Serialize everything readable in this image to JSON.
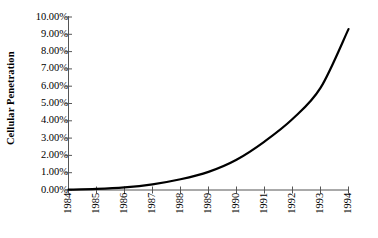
{
  "chart_data": {
    "type": "line",
    "title": "",
    "xlabel": "",
    "ylabel": "Cellular Penetration",
    "categories": [
      "1984",
      "1985",
      "1986",
      "1987",
      "1988",
      "1989",
      "1990",
      "1991",
      "1992",
      "1993",
      "1994"
    ],
    "x": [
      1984,
      1985,
      1986,
      1987,
      1988,
      1989,
      1990,
      1991,
      1992,
      1993,
      1994
    ],
    "values": [
      0.02,
      0.06,
      0.15,
      0.33,
      0.62,
      1.05,
      1.75,
      2.8,
      4.1,
      5.9,
      9.3
    ],
    "ylim": [
      0,
      10
    ],
    "xlim": [
      1984,
      1994
    ],
    "ytick_values": [
      0,
      1,
      2,
      3,
      4,
      5,
      6,
      7,
      8,
      9,
      10
    ],
    "ytick_labels": [
      "0.00%",
      "1.00%",
      "2.00%",
      "3.00%",
      "4.00%",
      "5.00%",
      "6.00%",
      "7.00%",
      "8.00%",
      "9.00%",
      "10.00%"
    ],
    "grid": false,
    "legend": false,
    "legend_position": "none",
    "series": [
      {
        "name": "Cellular Penetration",
        "color": "#000000",
        "line_width": 2.2,
        "values": [
          0.02,
          0.06,
          0.15,
          0.33,
          0.62,
          1.05,
          1.75,
          2.8,
          4.1,
          5.9,
          9.3
        ]
      }
    ],
    "axis_color": "#555555",
    "background": "#ffffff"
  }
}
